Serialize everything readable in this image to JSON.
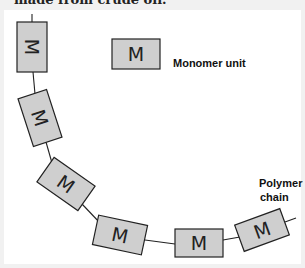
{
  "caption": {
    "top_text": "made from crude oil."
  },
  "legend": {
    "symbol_letter": "M",
    "label": "Monomer unit"
  },
  "chain": {
    "label_line1": "Polymer",
    "label_line2": "chain",
    "units": [
      {
        "letter": "M",
        "cx": 32,
        "cy": 47,
        "rotation": 90
      },
      {
        "letter": "M",
        "cx": 40,
        "cy": 118,
        "rotation": 72
      },
      {
        "letter": "M",
        "cx": 66,
        "cy": 184,
        "rotation": 35
      },
      {
        "letter": "M",
        "cx": 120,
        "cy": 235,
        "rotation": 12
      },
      {
        "letter": "M",
        "cx": 199,
        "cy": 243,
        "rotation": 0
      },
      {
        "letter": "M",
        "cx": 262,
        "cy": 230,
        "rotation": -20
      }
    ]
  },
  "colors": {
    "box_fill": "#cfcfcf",
    "box_stroke": "#222222",
    "frame": "#f1f1f1",
    "panel": "#ffffff"
  }
}
